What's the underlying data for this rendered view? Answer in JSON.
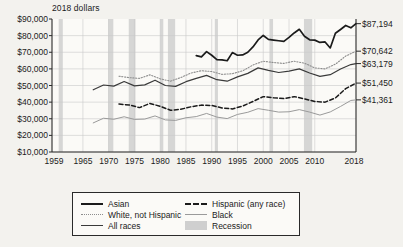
{
  "chart_data": {
    "type": "line",
    "title": "",
    "unit_label": "2018 dollars",
    "xlabel": "",
    "ylabel": "",
    "xlim": [
      1959,
      2018
    ],
    "ylim": [
      0,
      90000
    ],
    "grid": true,
    "legend_position": "bottom",
    "y_ticks": [
      "$10,000",
      "$20,000",
      "$30,000",
      "$40,000",
      "$50,000",
      "$60,000",
      "$70,000",
      "$80,000",
      "$90,000"
    ],
    "y_tick_values": [
      10000,
      20000,
      30000,
      40000,
      50000,
      60000,
      70000,
      80000,
      90000
    ],
    "x_ticks": [
      "1959",
      "1965",
      "1970",
      "1975",
      "1980",
      "1985",
      "1990",
      "1995",
      "2000",
      "2005",
      "2010",
      "2018"
    ],
    "x_tick_values": [
      1959,
      1965,
      1970,
      1975,
      1980,
      1985,
      1990,
      1995,
      2000,
      2005,
      2010,
      2018
    ],
    "end_labels": [
      {
        "text": "$87,194",
        "series": "Asian",
        "value": 87194
      },
      {
        "text": "$70,642",
        "series": "White, not Hispanic",
        "value": 70642
      },
      {
        "text": "$63,179",
        "series": "All races",
        "value": 63179
      },
      {
        "text": "$51,450",
        "series": "Hispanic (any race)",
        "value": 51450
      },
      {
        "text": "$41,361",
        "series": "Black",
        "value": 41361
      }
    ],
    "series": [
      {
        "name": "Asian",
        "style": "solid-thick",
        "color": "#1b1b1b",
        "x": [
          1987,
          1988,
          1989,
          1990,
          1991,
          1992,
          1993,
          1994,
          1995,
          1996,
          1997,
          1998,
          1999,
          2000,
          2001,
          2002,
          2003,
          2004,
          2005,
          2006,
          2007,
          2008,
          2009,
          2010,
          2011,
          2012,
          2013,
          2014,
          2015,
          2016,
          2017,
          2018
        ],
        "values": [
          68000,
          67200,
          70400,
          68200,
          65600,
          65400,
          64900,
          69800,
          68200,
          68400,
          70000,
          73200,
          77400,
          80100,
          77700,
          77300,
          76900,
          76500,
          78900,
          81600,
          83800,
          79600,
          77500,
          77300,
          75900,
          76200,
          72600,
          81400,
          83700,
          86100,
          84700,
          87194
        ]
      },
      {
        "name": "White, not Hispanic",
        "style": "dotted",
        "color": "#8d8d8d",
        "x": [
          1972,
          1974,
          1976,
          1978,
          1980,
          1982,
          1984,
          1986,
          1988,
          1990,
          1992,
          1994,
          1996,
          1998,
          2000,
          2002,
          2004,
          2006,
          2008,
          2010,
          2012,
          2014,
          2016,
          2018
        ],
        "values": [
          55600,
          54700,
          54300,
          56400,
          54000,
          52600,
          54800,
          57500,
          58900,
          58400,
          56700,
          57100,
          58800,
          62300,
          64600,
          63800,
          63300,
          64600,
          63400,
          60600,
          60000,
          62800,
          67700,
          70642
        ]
      },
      {
        "name": "All races",
        "style": "solid",
        "color": "#3a3a3a",
        "x": [
          1967,
          1969,
          1971,
          1973,
          1975,
          1977,
          1979,
          1981,
          1983,
          1985,
          1987,
          1989,
          1991,
          1993,
          1995,
          1997,
          1999,
          2001,
          2003,
          2005,
          2007,
          2009,
          2011,
          2013,
          2015,
          2017,
          2018
        ],
        "values": [
          47400,
          50300,
          49600,
          52400,
          49800,
          50400,
          53200,
          50000,
          49500,
          52300,
          54300,
          56100,
          53500,
          52600,
          55200,
          57300,
          60600,
          59100,
          57800,
          58700,
          60000,
          57500,
          55500,
          56500,
          59900,
          62600,
          63179
        ]
      },
      {
        "name": "Hispanic (any race)",
        "style": "dashed",
        "color": "#1b1b1b",
        "x": [
          1972,
          1974,
          1976,
          1978,
          1980,
          1982,
          1984,
          1986,
          1988,
          1990,
          1992,
          1994,
          1996,
          1998,
          2000,
          2002,
          2004,
          2006,
          2008,
          2010,
          2012,
          2014,
          2016,
          2018
        ],
        "values": [
          38800,
          38300,
          36700,
          39200,
          37500,
          35100,
          35700,
          37200,
          38200,
          38000,
          36500,
          35900,
          37600,
          40400,
          43300,
          42600,
          42100,
          43300,
          42000,
          40400,
          40000,
          42500,
          48100,
          51450
        ]
      },
      {
        "name": "Black",
        "style": "solid-light",
        "color": "#9a9a9a",
        "x": [
          1967,
          1969,
          1971,
          1973,
          1975,
          1977,
          1979,
          1981,
          1983,
          1985,
          1987,
          1989,
          1991,
          1993,
          1995,
          1997,
          1999,
          2001,
          2003,
          2005,
          2007,
          2009,
          2011,
          2013,
          2015,
          2017,
          2018
        ],
        "values": [
          27500,
          30300,
          29700,
          31200,
          29600,
          29800,
          31700,
          29300,
          29000,
          30600,
          31300,
          33200,
          31000,
          30100,
          32600,
          33900,
          36100,
          35100,
          34000,
          34200,
          35500,
          34000,
          32200,
          34100,
          37400,
          41000,
          41361
        ]
      }
    ],
    "recessions": [
      {
        "start": 1960.3,
        "end": 1961.1
      },
      {
        "start": 1969.9,
        "end": 1970.9
      },
      {
        "start": 1973.9,
        "end": 1975.2
      },
      {
        "start": 1980.0,
        "end": 1980.6
      },
      {
        "start": 1981.5,
        "end": 1982.9
      },
      {
        "start": 1990.6,
        "end": 1991.2
      },
      {
        "start": 2001.2,
        "end": 2001.9
      },
      {
        "start": 2007.9,
        "end": 2009.5
      }
    ]
  },
  "legend": {
    "items": [
      {
        "label": "Asian",
        "swatch": "solid-thick"
      },
      {
        "label": "Hispanic (any race)",
        "swatch": "dashed"
      },
      {
        "label": "White, not Hispanic",
        "swatch": "dotted"
      },
      {
        "label": "Black",
        "swatch": "solid-light"
      },
      {
        "label": "All races",
        "swatch": "solid"
      },
      {
        "label": "Recession",
        "swatch": "band"
      }
    ]
  },
  "colors": {
    "background": "#f3f2ee",
    "plot_background": "#fbfaf7",
    "axis": "#2a2a2a",
    "grid": "#c9c9c9",
    "recession_band": "#cfcfcf"
  }
}
